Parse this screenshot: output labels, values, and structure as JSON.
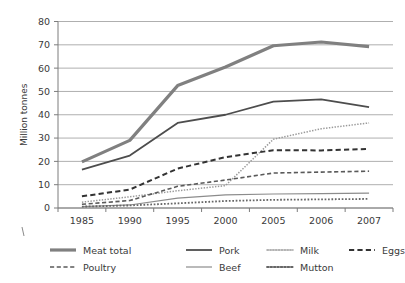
{
  "chart_data": {
    "type": "line",
    "title": "",
    "xlabel": "",
    "ylabel": "Million tonnes",
    "categories": [
      "1985",
      "1990",
      "1995",
      "2000",
      "2005",
      "2006",
      "2007"
    ],
    "ylim": [
      0,
      80
    ],
    "yticks": [
      0,
      10,
      20,
      30,
      40,
      50,
      60,
      70,
      80
    ],
    "grid": true,
    "legend_position": "bottom",
    "series": [
      {
        "name": "Meat total",
        "values": [
          19.8,
          29.0,
          52.5,
          60.5,
          69.6,
          71.2,
          69.2
        ],
        "style": "solid",
        "width": 3.2,
        "color": "#808080"
      },
      {
        "name": "Pork",
        "values": [
          16.5,
          22.5,
          36.5,
          40.0,
          45.6,
          46.6,
          43.3
        ],
        "style": "solid",
        "width": 1.8,
        "color": "#4d4d4d"
      },
      {
        "name": "Milk",
        "values": [
          2.5,
          4.8,
          7.4,
          9.6,
          29.5,
          34.0,
          36.5
        ],
        "style": "dotted",
        "width": 1.5,
        "color": "#9a9a9a"
      },
      {
        "name": "Eggs",
        "values": [
          5.0,
          7.9,
          16.9,
          21.8,
          24.8,
          24.7,
          25.3
        ],
        "style": "dashed",
        "width": 2.0,
        "color": "#333333"
      },
      {
        "name": "Poultry",
        "values": [
          1.6,
          3.2,
          9.3,
          12.0,
          15.0,
          15.4,
          15.8
        ],
        "style": "dashed",
        "width": 1.6,
        "color": "#5a5a5a"
      },
      {
        "name": "Beef",
        "values": [
          0.6,
          1.3,
          4.2,
          5.6,
          6.0,
          6.2,
          6.4
        ],
        "style": "solid",
        "width": 1.2,
        "color": "#8c8c8c"
      },
      {
        "name": "Mutton",
        "values": [
          0.6,
          1.1,
          2.0,
          3.0,
          3.5,
          3.7,
          3.9
        ],
        "style": "dotted",
        "width": 1.8,
        "color": "#666666"
      }
    ],
    "legend_rows": [
      [
        "Meat total",
        "Pork",
        "Milk",
        "Eggs"
      ],
      [
        "Poultry",
        "Beef",
        "Mutton"
      ]
    ]
  },
  "colors": {
    "background": "#ffffff",
    "grid": "#9a9a9a",
    "axis": "#7d7d7d",
    "text": "#3a3a3a"
  }
}
